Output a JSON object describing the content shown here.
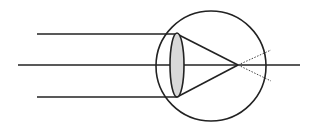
{
  "diagram": {
    "title": "",
    "colors": {
      "stroke": "#222222",
      "lens_fill": "#d9d9d9",
      "background": "#ffffff"
    },
    "elements": {
      "eyeball": {
        "cx": 211,
        "cy": 66,
        "r": 55
      },
      "lens": {
        "cx": 177,
        "cy": 65,
        "rx": 7,
        "ry": 32
      },
      "optical_axis": {
        "x1": 18,
        "y1": 65,
        "x2": 300,
        "y2": 65
      },
      "incoming_rays": [
        {
          "x1": 37,
          "y1": 34,
          "x2": 177,
          "y2": 34
        },
        {
          "x1": 37,
          "y1": 97,
          "x2": 177,
          "y2": 97
        }
      ],
      "refracted_rays": [
        {
          "x1": 177,
          "y1": 34,
          "x2": 238,
          "y2": 65
        },
        {
          "x1": 177,
          "y1": 97,
          "x2": 238,
          "y2": 65
        }
      ],
      "dotted_extensions": [
        {
          "x1": 238,
          "y1": 65,
          "x2": 271,
          "y2": 50
        },
        {
          "x1": 238,
          "y1": 65,
          "x2": 271,
          "y2": 81
        }
      ],
      "focal_point": {
        "x": 238,
        "y": 65
      }
    }
  }
}
